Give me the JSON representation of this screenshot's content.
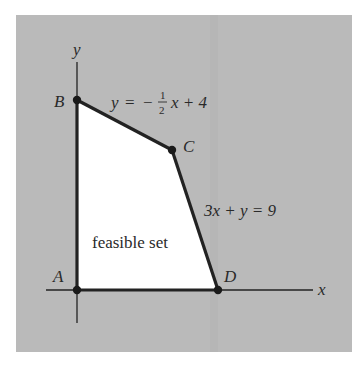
{
  "figure": {
    "background_color": "#bababa",
    "region_color": "#ffffff",
    "line_color": "#222222",
    "axes": {
      "x_label": "x",
      "y_label": "y"
    },
    "vertices": [
      {
        "id": "A",
        "label": "A"
      },
      {
        "id": "B",
        "label": "B"
      },
      {
        "id": "C",
        "label": "C"
      },
      {
        "id": "D",
        "label": "D"
      }
    ],
    "constraints": {
      "line1": {
        "lhs": "y",
        "eq": "=",
        "sign": "−",
        "frac_num": "1",
        "frac_den": "2",
        "rest": "x + 4"
      },
      "line2": {
        "text": "3x + y = 9"
      }
    },
    "region_label": "feasible set"
  }
}
